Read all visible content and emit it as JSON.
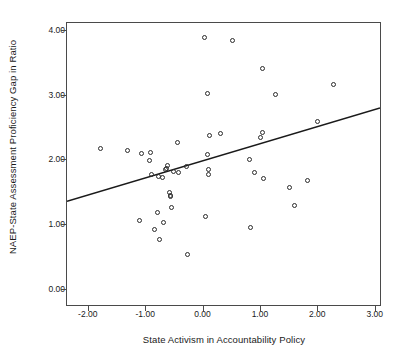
{
  "chart_data": {
    "type": "scatter",
    "title": "",
    "xlabel": "State Activism in Accountability Policy",
    "ylabel": "NAEP-State Assessment Proficiency Gap in Ratio",
    "xlim": [
      -2.38,
      3.11
    ],
    "ylim": [
      -0.26,
      4.12
    ],
    "xticks": [
      -2.0,
      -1.0,
      0.0,
      1.0,
      2.0,
      3.0
    ],
    "xtick_labels": [
      "-2.00",
      "-1.00",
      "0.00",
      "1.00",
      "2.00",
      "3.00"
    ],
    "yticks": [
      0.0,
      1.0,
      2.0,
      3.0,
      4.0
    ],
    "ytick_labels": [
      "0.00",
      "1.00",
      "2.00",
      "3.00",
      "4.00"
    ],
    "grid": false,
    "legend": null,
    "marker": "open-circle",
    "marker_color": "#2b2b2b",
    "line_color": "#1a1a1a",
    "points": [
      {
        "x": -1.8,
        "y": 2.19
      },
      {
        "x": -1.32,
        "y": 2.16
      },
      {
        "x": -1.09,
        "y": 2.1
      },
      {
        "x": -1.11,
        "y": 1.08
      },
      {
        "x": -0.95,
        "y": 2.0
      },
      {
        "x": -0.93,
        "y": 2.12
      },
      {
        "x": -0.9,
        "y": 1.79
      },
      {
        "x": -0.86,
        "y": 0.93
      },
      {
        "x": -0.8,
        "y": 1.2
      },
      {
        "x": -0.78,
        "y": 1.75
      },
      {
        "x": -0.77,
        "y": 0.78
      },
      {
        "x": -0.72,
        "y": 1.74
      },
      {
        "x": -0.69,
        "y": 1.05
      },
      {
        "x": -0.66,
        "y": 1.86
      },
      {
        "x": -0.64,
        "y": 1.88
      },
      {
        "x": -0.62,
        "y": 1.92
      },
      {
        "x": -0.6,
        "y": 1.51
      },
      {
        "x": -0.58,
        "y": 1.46
      },
      {
        "x": -0.57,
        "y": 1.44
      },
      {
        "x": -0.56,
        "y": 1.28
      },
      {
        "x": -0.52,
        "y": 1.83
      },
      {
        "x": -0.46,
        "y": 2.27
      },
      {
        "x": -0.44,
        "y": 1.82
      },
      {
        "x": -0.3,
        "y": 1.9
      },
      {
        "x": -0.28,
        "y": 0.55
      },
      {
        "x": 0.02,
        "y": 3.89
      },
      {
        "x": 0.04,
        "y": 1.13
      },
      {
        "x": 0.06,
        "y": 3.03
      },
      {
        "x": 0.06,
        "y": 2.09
      },
      {
        "x": 0.08,
        "y": 1.86
      },
      {
        "x": 0.09,
        "y": 1.79
      },
      {
        "x": 0.1,
        "y": 2.38
      },
      {
        "x": 0.29,
        "y": 2.41
      },
      {
        "x": 0.5,
        "y": 3.85
      },
      {
        "x": 0.8,
        "y": 2.01
      },
      {
        "x": 0.82,
        "y": 0.97
      },
      {
        "x": 0.88,
        "y": 1.82
      },
      {
        "x": 1.0,
        "y": 2.36
      },
      {
        "x": 1.02,
        "y": 2.43
      },
      {
        "x": 1.03,
        "y": 3.42
      },
      {
        "x": 1.05,
        "y": 1.72
      },
      {
        "x": 1.25,
        "y": 3.01
      },
      {
        "x": 1.49,
        "y": 1.59
      },
      {
        "x": 1.58,
        "y": 1.3
      },
      {
        "x": 1.82,
        "y": 1.69
      },
      {
        "x": 1.99,
        "y": 2.6
      },
      {
        "x": 2.27,
        "y": 3.17
      }
    ],
    "fit_line": {
      "label": "linear fit",
      "x_start": -2.38,
      "y_start": 1.35,
      "x_end": 3.11,
      "y_end": 2.8
    }
  }
}
